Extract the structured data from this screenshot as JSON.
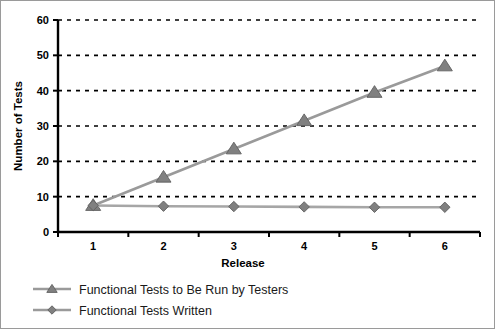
{
  "chart_data": {
    "type": "line",
    "title": "",
    "xlabel": "Release",
    "ylabel": "Number of Tests",
    "categories": [
      "1",
      "2",
      "3",
      "4",
      "5",
      "6"
    ],
    "x": [
      1,
      2,
      3,
      4,
      5,
      6
    ],
    "xlim": [
      0.5,
      6.5
    ],
    "ylim": [
      0,
      60
    ],
    "yticks": [
      0,
      10,
      20,
      30,
      40,
      50,
      60
    ],
    "ytick_labels": [
      "0",
      "10",
      "20",
      "30",
      "40",
      "50",
      "60"
    ],
    "xtick_labels": [
      "1",
      "2",
      "3",
      "4",
      "5",
      "6"
    ],
    "grid": {
      "horizontal": true,
      "vertical": false,
      "style": "dashed",
      "color": "#000000"
    },
    "legend": {
      "position": "bottom-left",
      "entries": [
        {
          "name": "Functional Tests to Be Run by Testers",
          "marker": "triangle",
          "color": "#9a9a9a",
          "marker_color": "#808080"
        },
        {
          "name": "Functional Tests Written",
          "marker": "diamond",
          "color": "#9a9a9a",
          "marker_color": "#808080"
        }
      ]
    },
    "series": [
      {
        "name": "Functional Tests to Be Run by Testers",
        "marker": "triangle",
        "color": "#9a9a9a",
        "marker_color": "#808080",
        "values": [
          7.5,
          15.5,
          23.5,
          31.5,
          39.5,
          47
        ]
      },
      {
        "name": "Functional Tests Written",
        "marker": "diamond",
        "color": "#a6a6a6",
        "marker_color": "#808080",
        "values": [
          7.5,
          7.3,
          7.2,
          7.1,
          7.0,
          7.0
        ]
      }
    ]
  },
  "axes": {
    "y_title": "Number of Tests",
    "x_title": "Release"
  },
  "legend": {
    "item_0": "Functional Tests to Be Run by Testers",
    "item_1": "Functional Tests Written"
  },
  "ticks": {
    "y": [
      "60",
      "50",
      "40",
      "30",
      "20",
      "10",
      "0"
    ],
    "x": [
      "1",
      "2",
      "3",
      "4",
      "5",
      "6"
    ]
  }
}
